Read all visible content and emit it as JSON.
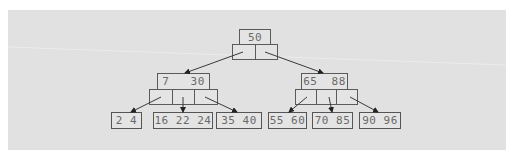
{
  "diagram": {
    "type": "b-tree",
    "colors": {
      "panel_background": "#e1e1e1",
      "node_border": "#5a5a5a",
      "text": "#6a6a6a",
      "edge": "#3a3a3a"
    },
    "root": {
      "keys_label": "50",
      "keys": [
        50
      ],
      "pointer_count": 2
    },
    "internal": [
      {
        "keys_label": "7   30",
        "keys": [
          7,
          30
        ],
        "pointer_count": 3
      },
      {
        "keys_label": "65  88",
        "keys": [
          65,
          88
        ],
        "pointer_count": 3
      }
    ],
    "leaves": [
      {
        "label": "2 4",
        "keys": [
          2,
          4
        ]
      },
      {
        "label": "16 22 24",
        "keys": [
          16,
          22,
          24
        ]
      },
      {
        "label": "35 40",
        "keys": [
          35,
          40
        ]
      },
      {
        "label": "55 60",
        "keys": [
          55,
          60
        ]
      },
      {
        "label": "70 85",
        "keys": [
          70,
          85
        ]
      },
      {
        "label": "90 96",
        "keys": [
          90,
          96
        ]
      }
    ],
    "edges": [
      {
        "from": "root.ptr0",
        "to": "internal0"
      },
      {
        "from": "root.ptr1",
        "to": "internal1"
      },
      {
        "from": "internal0.ptr0",
        "to": "leaf0"
      },
      {
        "from": "internal0.ptr1",
        "to": "leaf1"
      },
      {
        "from": "internal0.ptr2",
        "to": "leaf2"
      },
      {
        "from": "internal1.ptr0",
        "to": "leaf3"
      },
      {
        "from": "internal1.ptr1",
        "to": "leaf4"
      },
      {
        "from": "internal1.ptr2",
        "to": "leaf5"
      }
    ]
  }
}
